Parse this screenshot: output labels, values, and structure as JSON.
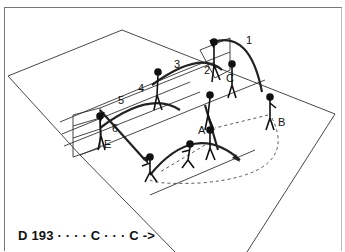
{
  "diagram": {
    "caption": "D 193 · · · · C · · · C ->",
    "figure_labels": [
      "A",
      "B",
      "C",
      "E"
    ],
    "arc_labels": [
      "1",
      "2",
      "3",
      "4",
      "5",
      "6"
    ],
    "colors": {
      "line": "#222222",
      "background": "#ffffff",
      "frame": "#777777"
    }
  }
}
